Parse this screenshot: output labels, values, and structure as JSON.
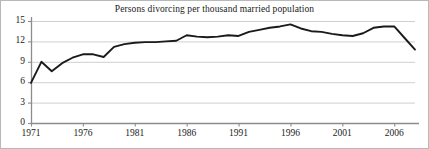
{
  "chart_data": {
    "type": "line",
    "title": "Persons divorcing per thousand married population",
    "xlabel": "",
    "ylabel": "",
    "xlim": [
      1971,
      2008
    ],
    "ylim": [
      0,
      15
    ],
    "grid": true,
    "legend": "none",
    "line_color": "#1a1a1a",
    "gridline_color": "#cfcfcf",
    "axis_color": "#8c8c8c",
    "background_color": "#ffffff",
    "border_color": "#b8b8b8",
    "ytick_labels": [
      "15",
      "12",
      "9",
      "6",
      "3",
      "0"
    ],
    "ytick_values": [
      15,
      12,
      9,
      6,
      3,
      0
    ],
    "xtick_labels": [
      "1971",
      "1976",
      "1981",
      "1986",
      "1991",
      "1996",
      "2001",
      "2006"
    ],
    "xtick_values": [
      1971,
      1976,
      1981,
      1986,
      1991,
      1996,
      2001,
      2006
    ],
    "x": [
      1971,
      1972,
      1973,
      1974,
      1975,
      1976,
      1977,
      1978,
      1979,
      1980,
      1981,
      1982,
      1983,
      1984,
      1985,
      1986,
      1987,
      1988,
      1989,
      1990,
      1991,
      1992,
      1993,
      1994,
      1995,
      1996,
      1997,
      1998,
      1999,
      2000,
      2001,
      2002,
      2003,
      2004,
      2005,
      2006,
      2007,
      2008
    ],
    "values": [
      5.9,
      9.0,
      7.6,
      8.8,
      9.6,
      10.1,
      10.1,
      9.7,
      11.2,
      11.6,
      11.8,
      11.9,
      11.9,
      12.0,
      12.1,
      12.9,
      12.7,
      12.6,
      12.7,
      12.9,
      12.8,
      13.4,
      13.7,
      14.0,
      14.2,
      14.5,
      13.9,
      13.5,
      13.4,
      13.1,
      12.9,
      12.8,
      13.2,
      14.0,
      14.2,
      14.2,
      12.5,
      10.8
    ]
  }
}
